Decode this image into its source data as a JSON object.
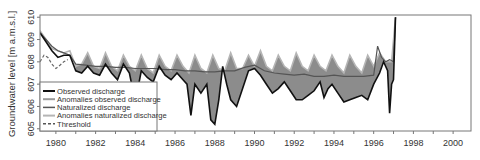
{
  "chart_data": {
    "type": "line",
    "title": "",
    "xlabel": "",
    "ylabel": "Groundwater level [m a.m.s.l.]",
    "xlim": [
      1979.2,
      2000.9
    ],
    "ylim": [
      604.9,
      610.1
    ],
    "grid": false,
    "legend_position": "lower-left",
    "x_ticks": [
      1980,
      1982,
      1984,
      1986,
      1988,
      1990,
      1992,
      1994,
      1996,
      1998,
      2000
    ],
    "x_minor_ticks": [
      1981,
      1983,
      1985,
      1987,
      1989,
      1991,
      1993,
      1995,
      1997,
      1999
    ],
    "y_ticks": [
      605,
      606,
      607,
      608,
      609,
      610
    ],
    "legend": [
      {
        "label": "Observed discharge",
        "style": "solid",
        "color": "#111111",
        "width": 2
      },
      {
        "label": "Anomalies observed discharge",
        "style": "solid",
        "color": "#9a9a9a",
        "width": 2
      },
      {
        "label": "Naturalized discharge",
        "style": "solid",
        "color": "#555555",
        "width": 1.5
      },
      {
        "label": "Anomalies naturalized discharge",
        "style": "solid",
        "color": "#b5b5b5",
        "width": 2
      },
      {
        "label": "Threshold",
        "style": "dashed",
        "color": "#555555",
        "width": 1.5
      }
    ],
    "series": [
      {
        "name": "Threshold",
        "x": [
          1979.2,
          1979.4,
          1979.6,
          1979.8,
          1980.0,
          1980.2,
          1980.4,
          1980.6
        ],
        "y": [
          608.0,
          608.3,
          608.2,
          607.9,
          607.7,
          607.85,
          608.0,
          608.1
        ]
      },
      {
        "name": "Naturalized discharge",
        "x": [
          1979.2,
          1979.5,
          1979.8,
          1980.1,
          1980.4,
          1980.7,
          1981.0,
          1981.5,
          1982.0,
          1982.5,
          1983.0,
          1983.5,
          1984.0,
          1984.5,
          1985.0,
          1985.5,
          1986.0,
          1986.5,
          1987.0,
          1987.5,
          1988.0,
          1988.5,
          1989.0,
          1989.5,
          1990.0,
          1990.5,
          1991.0,
          1991.5,
          1992.0,
          1992.5,
          1993.0,
          1993.5,
          1994.0,
          1994.5,
          1995.0,
          1995.5,
          1996.0,
          1996.2,
          1996.4,
          1996.6,
          1996.8,
          1997.0,
          1997.1
        ],
        "y": [
          609.3,
          609.0,
          608.7,
          608.5,
          608.4,
          608.3,
          607.9,
          607.85,
          607.8,
          607.8,
          607.75,
          607.75,
          607.7,
          607.7,
          607.7,
          607.65,
          607.65,
          607.6,
          607.6,
          607.55,
          607.55,
          607.6,
          607.6,
          607.75,
          607.85,
          607.6,
          607.5,
          607.45,
          607.4,
          607.45,
          607.35,
          607.35,
          607.4,
          607.35,
          607.35,
          607.35,
          607.4,
          608.7,
          608.2,
          608.0,
          608.1,
          608.0,
          610.0
        ]
      },
      {
        "name": "Anomalies naturalized discharge (upper envelope)",
        "x": [
          1979.2,
          1979.5,
          1979.8,
          1980.1,
          1980.4,
          1980.7,
          1981.0,
          1981.3,
          1981.6,
          1981.9,
          1982.2,
          1982.5,
          1982.8,
          1983.1,
          1983.4,
          1983.7,
          1984.0,
          1984.3,
          1984.6,
          1984.9,
          1985.2,
          1985.5,
          1985.8,
          1986.1,
          1986.4,
          1986.7,
          1987.0,
          1987.3,
          1987.6,
          1987.9,
          1988.2,
          1988.5,
          1988.8,
          1989.1,
          1989.4,
          1989.7,
          1990.0,
          1990.3,
          1990.6,
          1990.9,
          1991.2,
          1991.5,
          1991.8,
          1992.1,
          1992.4,
          1992.7,
          1993.0,
          1993.3,
          1993.6,
          1993.9,
          1994.2,
          1994.5,
          1994.8,
          1995.1,
          1995.4,
          1995.7,
          1996.0,
          1996.3,
          1996.6,
          1996.9,
          1997.1
        ],
        "y": [
          609.4,
          609.0,
          608.6,
          608.5,
          608.4,
          608.5,
          607.8,
          607.9,
          608.4,
          607.8,
          607.7,
          608.4,
          607.8,
          607.6,
          608.3,
          607.8,
          607.6,
          608.3,
          607.7,
          607.5,
          608.3,
          607.8,
          607.6,
          608.3,
          607.8,
          607.5,
          608.3,
          607.7,
          607.5,
          608.3,
          607.7,
          607.6,
          608.4,
          607.7,
          607.7,
          608.3,
          607.8,
          608.5,
          607.8,
          607.6,
          608.3,
          607.8,
          607.6,
          608.4,
          607.8,
          607.6,
          608.3,
          607.8,
          607.6,
          608.3,
          607.8,
          607.5,
          608.3,
          607.8,
          607.5,
          608.3,
          607.8,
          608.4,
          608.0,
          608.0,
          610.0
        ]
      },
      {
        "name": "Observed discharge",
        "x": [
          1979.2,
          1979.5,
          1979.8,
          1980.1,
          1980.4,
          1980.7,
          1981.0,
          1981.3,
          1981.6,
          1981.9,
          1982.2,
          1982.5,
          1982.8,
          1983.1,
          1983.4,
          1983.7,
          1984.0,
          1984.3,
          1984.6,
          1984.9,
          1985.2,
          1985.5,
          1985.8,
          1986.1,
          1986.4,
          1986.6,
          1986.8,
          1987.0,
          1987.3,
          1987.6,
          1987.8,
          1988.0,
          1988.2,
          1988.4,
          1988.6,
          1988.8,
          1989.1,
          1989.4,
          1989.7,
          1990.0,
          1990.3,
          1990.6,
          1990.9,
          1991.2,
          1991.5,
          1991.8,
          1992.1,
          1992.4,
          1992.7,
          1993.0,
          1993.3,
          1993.5,
          1993.7,
          1993.9,
          1994.2,
          1994.5,
          1994.8,
          1995.1,
          1995.4,
          1995.7,
          1996.0,
          1996.3,
          1996.5,
          1996.7,
          1996.8,
          1996.9,
          1997.0,
          1997.1
        ],
        "y": [
          609.3,
          608.9,
          608.5,
          608.2,
          608.3,
          608.3,
          607.6,
          607.5,
          607.8,
          607.5,
          607.4,
          607.9,
          607.5,
          607.2,
          607.9,
          607.5,
          606.2,
          607.6,
          607.3,
          607.1,
          607.8,
          607.4,
          607.2,
          607.5,
          607.2,
          607.0,
          605.6,
          607.0,
          606.6,
          607.0,
          605.4,
          605.2,
          606.3,
          607.8,
          607.0,
          606.3,
          606.0,
          606.8,
          607.6,
          607.7,
          607.4,
          607.0,
          606.6,
          606.8,
          607.1,
          606.7,
          606.3,
          606.3,
          606.5,
          606.7,
          607.1,
          606.4,
          606.8,
          607.0,
          606.6,
          606.2,
          606.3,
          606.4,
          606.5,
          606.3,
          607.0,
          607.5,
          608.0,
          607.6,
          605.7,
          607.0,
          607.2,
          610.0
        ]
      }
    ]
  }
}
